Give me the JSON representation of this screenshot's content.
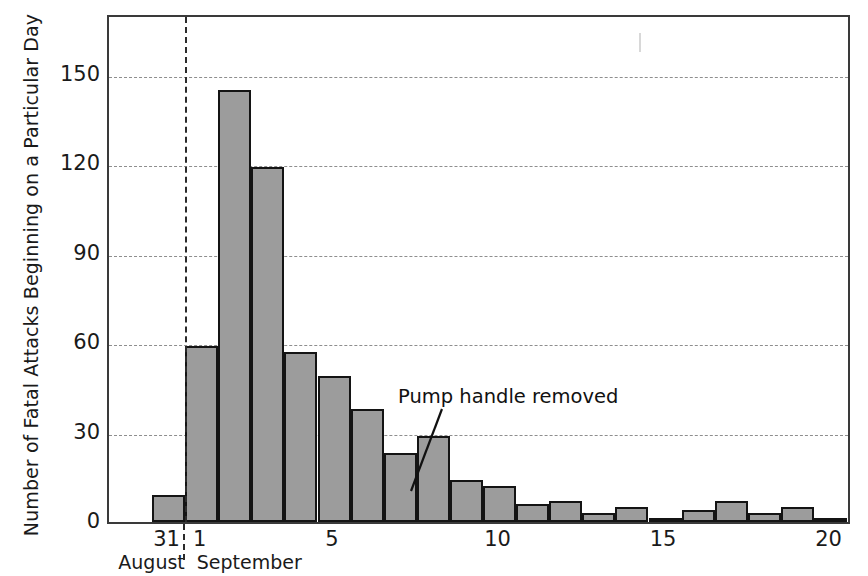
{
  "chart_data": {
    "type": "bar",
    "title": "",
    "xlabel": "",
    "ylabel": "Number of Fatal Attacks Beginning on a Particular Day",
    "ylim": [
      0,
      170
    ],
    "yticks": [
      0,
      30,
      60,
      90,
      120,
      150
    ],
    "ytick_labels": [
      "0",
      "30",
      "60",
      "90",
      "120",
      "150"
    ],
    "grid": true,
    "legend": false,
    "categories": [
      "Aug 31",
      "Sep 1",
      "Sep 2",
      "Sep 3",
      "Sep 4",
      "Sep 5",
      "Sep 6",
      "Sep 7",
      "Sep 8",
      "Sep 9",
      "Sep 10",
      "Sep 11",
      "Sep 12",
      "Sep 13",
      "Sep 14",
      "Sep 15",
      "Sep 16",
      "Sep 17",
      "Sep 18",
      "Sep 19",
      "Sep 20"
    ],
    "values": [
      9,
      59,
      145,
      119,
      57,
      49,
      38,
      23,
      29,
      14,
      12,
      6,
      7,
      3,
      5,
      1,
      4,
      7,
      3,
      5,
      1
    ],
    "xtick_labels": [
      "31",
      "1",
      "5",
      "10",
      "15",
      "20"
    ],
    "xtick_categories": [
      "Aug 31",
      "Sep 1",
      "Sep 5",
      "Sep 10",
      "Sep 15",
      "Sep 20"
    ],
    "month_labels": [
      "August",
      "September"
    ],
    "annotations": [
      {
        "text": "Pump handle removed",
        "points_to": "Sep 8"
      }
    ],
    "bar_fill_color": "#9c9c9c",
    "bar_edge_color": "#141414",
    "grid_color": "#8e8e8e",
    "background_color": "#ffffff"
  },
  "axes": {
    "y_title": "Number of Fatal Attacks Beginning on a Particular Day"
  }
}
